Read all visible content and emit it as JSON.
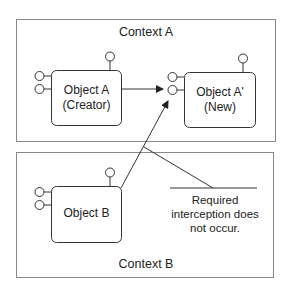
{
  "diagram": {
    "context_a": {
      "label": "Context A"
    },
    "context_b": {
      "label": "Context B"
    },
    "object_a": {
      "line1": "Object A",
      "line2": "(Creator)"
    },
    "object_a_new": {
      "line1": "Object A'",
      "line2": "(New)"
    },
    "object_b": {
      "label": "Object B"
    },
    "annotation": {
      "line1": "Required",
      "line2": "interception does",
      "line3": "not occur."
    },
    "colors": {
      "stroke": "#333333",
      "frame": "#888888",
      "background": "#ffffff"
    }
  }
}
